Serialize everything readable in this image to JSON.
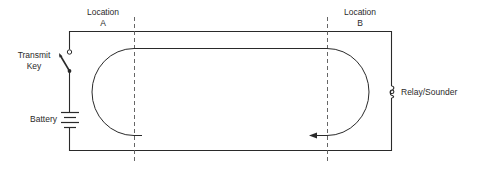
{
  "diagram": {
    "type": "telegraph-circuit",
    "locations": [
      {
        "name": "Location",
        "letter": "A"
      },
      {
        "name": "Location",
        "letter": "B"
      }
    ],
    "components": {
      "transmit_key": {
        "label_line1": "Transmit",
        "label_line2": "Key"
      },
      "battery": {
        "label": "Battery"
      },
      "relay": {
        "label": "Relay/Sounder"
      }
    },
    "colors": {
      "line": "#2a2a2a",
      "background": "#ffffff"
    }
  }
}
